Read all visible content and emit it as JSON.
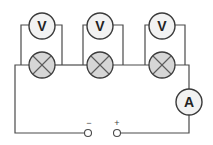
{
  "diagram": {
    "type": "series circuit with voltmeters across each lamp and an ammeter",
    "voltmeters": [
      {
        "label": "V"
      },
      {
        "label": "V"
      },
      {
        "label": "V"
      }
    ],
    "lamps": [
      {
        "symbol": "lamp"
      },
      {
        "symbol": "lamp"
      },
      {
        "symbol": "lamp"
      }
    ],
    "ammeter": {
      "label": "A"
    },
    "terminals": {
      "negative": "−",
      "positive": "+"
    },
    "colors": {
      "wire": "#4a4a4a",
      "lamp_fill": "#d6d6d6",
      "meter_fill": "#f2f2f2"
    }
  }
}
